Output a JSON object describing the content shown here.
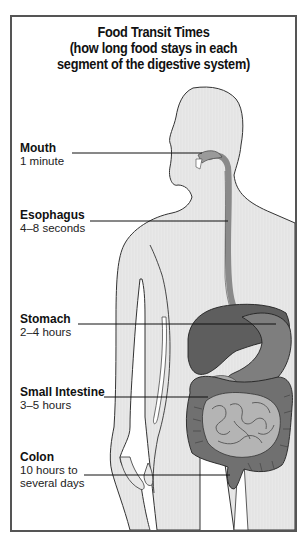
{
  "diagram": {
    "title_lines": [
      "Food Transit Times",
      "(how long food stays in each",
      "segment of the digestive system)"
    ],
    "labels": [
      {
        "name": "Mouth",
        "time": "1 minute"
      },
      {
        "name": "Esophagus",
        "time": "4–8 seconds"
      },
      {
        "name": "Stomach",
        "time": "2–4 hours"
      },
      {
        "name": "Small Intestine",
        "time": "3–5 hours"
      },
      {
        "name": "Colon",
        "time_lines": [
          "10 hours to",
          "several days"
        ]
      }
    ],
    "colors": {
      "frame": "#555555",
      "body_fill": "#e6e6e6",
      "body_outline": "#333333",
      "esophagus": "#8a8a8a",
      "liver": "#5a5a5a",
      "stomach": "#7a7a7a",
      "small_intestine": "#a9a9a9",
      "colon": "#6e6e6e",
      "leader_line": "#111111"
    }
  }
}
